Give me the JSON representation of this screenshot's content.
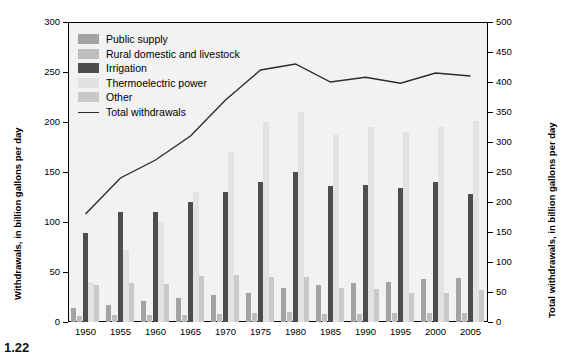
{
  "figure": {
    "caption": "1.22"
  },
  "legend": {
    "items": [
      {
        "label": "Public supply",
        "color": "#a3a3a3",
        "key": "public_supply",
        "swatch": "square"
      },
      {
        "label": "Rural domestic and livestock",
        "color": "#bdbdbd",
        "key": "rural",
        "swatch": "square"
      },
      {
        "label": "Irrigation",
        "color": "#4d4d4d",
        "key": "irrigation",
        "swatch": "square"
      },
      {
        "label": "Thermoelectric power",
        "color": "#e2e2e2",
        "key": "thermoelectric",
        "swatch": "square"
      },
      {
        "label": "Other",
        "color": "#c9c9c9",
        "key": "other",
        "swatch": "square"
      },
      {
        "label": "Total withdrawals",
        "color": "#2b2b2b",
        "key": "total",
        "swatch": "line"
      }
    ]
  },
  "axes": {
    "left": {
      "title": "Withdrawals, in billion gallons per day",
      "ticks": [
        0,
        50,
        100,
        150,
        200,
        250,
        300
      ],
      "min": 0,
      "max": 300
    },
    "right": {
      "title": "Total withdrawals, in billion gallons per day",
      "ticks": [
        0,
        50,
        100,
        150,
        200,
        250,
        300,
        350,
        400,
        450,
        500
      ],
      "min": 0,
      "max": 500
    },
    "x": {
      "ticks": [
        "1950",
        "1955",
        "1960",
        "1965",
        "1970",
        "1975",
        "1980",
        "1985",
        "1990",
        "1995",
        "2000",
        "2005"
      ]
    }
  },
  "chart_data": {
    "type": "bar",
    "title": "",
    "xlabel": "",
    "ylabel": "Withdrawals, in billion gallons per day",
    "ylim": [
      0,
      300
    ],
    "y2label": "Total withdrawals, in billion gallons per day",
    "y2lim": [
      0,
      500
    ],
    "grid": false,
    "legend_position": "upper-left-inside",
    "categories": [
      "1950",
      "1955",
      "1960",
      "1965",
      "1970",
      "1975",
      "1980",
      "1985",
      "1990",
      "1995",
      "2000",
      "2005"
    ],
    "series": [
      {
        "name": "Public supply",
        "axis": "left",
        "color": "#a3a3a3",
        "values": [
          14,
          17,
          21,
          24,
          27,
          29,
          34,
          37,
          39,
          40,
          43,
          44
        ]
      },
      {
        "name": "Rural domestic and livestock",
        "axis": "left",
        "color": "#bdbdbd",
        "values": [
          6,
          7,
          7,
          7,
          8,
          9,
          10,
          8,
          8,
          9,
          9,
          9
        ]
      },
      {
        "name": "Irrigation",
        "axis": "left",
        "color": "#4d4d4d",
        "values": [
          89,
          110,
          110,
          120,
          130,
          140,
          150,
          136,
          137,
          134,
          140,
          128
        ]
      },
      {
        "name": "Thermoelectric power",
        "axis": "left",
        "color": "#e2e2e2",
        "values": [
          40,
          72,
          100,
          130,
          170,
          200,
          210,
          187,
          195,
          190,
          195,
          201
        ]
      },
      {
        "name": "Other",
        "axis": "left",
        "color": "#c9c9c9",
        "values": [
          37,
          39,
          38,
          46,
          47,
          45,
          45,
          34,
          33,
          29,
          29,
          32
        ]
      }
    ],
    "line_series": {
      "name": "Total withdrawals",
      "axis": "right",
      "color": "#2b2b2b",
      "values": [
        180,
        240,
        270,
        310,
        370,
        420,
        430,
        400,
        408,
        398,
        415,
        410
      ]
    }
  }
}
